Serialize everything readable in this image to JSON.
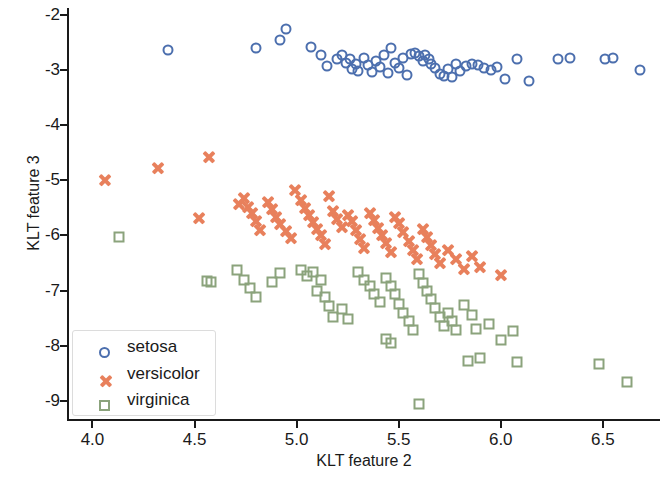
{
  "chart_data": {
    "type": "scatter",
    "title": "",
    "xlabel": "KLT feature 2",
    "ylabel": "KLT feature 3",
    "xlim": [
      3.88,
      6.78
    ],
    "ylim": [
      -9.35,
      -1.87
    ],
    "xticks": [
      4.0,
      4.5,
      5.0,
      5.5,
      6.0,
      6.5
    ],
    "xtick_labels": [
      "4.0",
      "4.5",
      "5.0",
      "5.5",
      "6.0",
      "6.5"
    ],
    "yticks": [
      -2,
      -3,
      -4,
      -5,
      -6,
      -7,
      -8,
      -9
    ],
    "ytick_labels": [
      "-2",
      "-3",
      "-4",
      "-5",
      "-6",
      "-7",
      "-8",
      "-9"
    ],
    "grid": false,
    "legend_position": "lower left",
    "series": [
      {
        "name": "setosa",
        "marker": "circle",
        "color": "#4c6fae",
        "points": [
          [
            4.37,
            -2.63
          ],
          [
            4.8,
            -2.6
          ],
          [
            4.92,
            -2.46
          ],
          [
            4.95,
            -2.26
          ],
          [
            5.07,
            -2.58
          ],
          [
            5.12,
            -2.72
          ],
          [
            5.15,
            -2.93
          ],
          [
            5.2,
            -2.8
          ],
          [
            5.22,
            -2.73
          ],
          [
            5.24,
            -2.86
          ],
          [
            5.26,
            -2.79
          ],
          [
            5.27,
            -2.98
          ],
          [
            5.29,
            -2.88
          ],
          [
            5.3,
            -3.01
          ],
          [
            5.33,
            -2.77
          ],
          [
            5.35,
            -2.9
          ],
          [
            5.37,
            -3.04
          ],
          [
            5.39,
            -2.83
          ],
          [
            5.41,
            -2.95
          ],
          [
            5.43,
            -2.72
          ],
          [
            5.45,
            -3.05
          ],
          [
            5.46,
            -2.6
          ],
          [
            5.48,
            -2.86
          ],
          [
            5.5,
            -2.96
          ],
          [
            5.52,
            -2.78
          ],
          [
            5.54,
            -3.08
          ],
          [
            5.56,
            -2.7
          ],
          [
            5.58,
            -2.68
          ],
          [
            5.6,
            -2.75
          ],
          [
            5.62,
            -2.84
          ],
          [
            5.63,
            -2.72
          ],
          [
            5.65,
            -2.79
          ],
          [
            5.66,
            -2.88
          ],
          [
            5.68,
            -2.96
          ],
          [
            5.7,
            -3.06
          ],
          [
            5.72,
            -3.11
          ],
          [
            5.74,
            -2.98
          ],
          [
            5.76,
            -3.12
          ],
          [
            5.78,
            -2.88
          ],
          [
            5.8,
            -3.02
          ],
          [
            5.83,
            -2.92
          ],
          [
            5.86,
            -2.88
          ],
          [
            5.89,
            -2.9
          ],
          [
            5.92,
            -2.96
          ],
          [
            5.95,
            -3.0
          ],
          [
            5.98,
            -2.95
          ],
          [
            6.02,
            -3.16
          ],
          [
            6.08,
            -2.8
          ],
          [
            6.14,
            -3.2
          ],
          [
            6.28,
            -2.8
          ],
          [
            6.34,
            -2.78
          ],
          [
            6.51,
            -2.8
          ],
          [
            6.55,
            -2.78
          ],
          [
            6.68,
            -3.0
          ]
        ]
      },
      {
        "name": "versicolor",
        "marker": "x",
        "color": "#e8805c",
        "points": [
          [
            4.06,
            -5.0
          ],
          [
            4.32,
            -4.78
          ],
          [
            4.57,
            -4.58
          ],
          [
            4.52,
            -5.68
          ],
          [
            4.72,
            -5.42
          ],
          [
            4.74,
            -5.32
          ],
          [
            4.76,
            -5.48
          ],
          [
            4.78,
            -5.6
          ],
          [
            4.8,
            -5.74
          ],
          [
            4.82,
            -5.9
          ],
          [
            4.86,
            -5.4
          ],
          [
            4.88,
            -5.52
          ],
          [
            4.9,
            -5.66
          ],
          [
            4.92,
            -5.8
          ],
          [
            4.95,
            -5.92
          ],
          [
            4.97,
            -6.04
          ],
          [
            4.99,
            -5.18
          ],
          [
            5.02,
            -5.36
          ],
          [
            5.04,
            -5.5
          ],
          [
            5.06,
            -5.62
          ],
          [
            5.08,
            -5.76
          ],
          [
            5.1,
            -5.88
          ],
          [
            5.12,
            -6.0
          ],
          [
            5.14,
            -6.16
          ],
          [
            5.16,
            -5.28
          ],
          [
            5.18,
            -5.56
          ],
          [
            5.2,
            -5.7
          ],
          [
            5.22,
            -5.84
          ],
          [
            5.25,
            -5.62
          ],
          [
            5.27,
            -5.74
          ],
          [
            5.29,
            -5.9
          ],
          [
            5.31,
            -6.06
          ],
          [
            5.33,
            -6.22
          ],
          [
            5.36,
            -5.6
          ],
          [
            5.38,
            -5.72
          ],
          [
            5.4,
            -5.86
          ],
          [
            5.42,
            -6.0
          ],
          [
            5.44,
            -6.14
          ],
          [
            5.46,
            -6.3
          ],
          [
            5.48,
            -5.66
          ],
          [
            5.5,
            -5.78
          ],
          [
            5.52,
            -5.94
          ],
          [
            5.55,
            -6.1
          ],
          [
            5.57,
            -6.26
          ],
          [
            5.59,
            -6.42
          ],
          [
            5.62,
            -5.88
          ],
          [
            5.64,
            -6.02
          ],
          [
            5.66,
            -6.18
          ],
          [
            5.68,
            -6.34
          ],
          [
            5.7,
            -6.5
          ],
          [
            5.74,
            -6.26
          ],
          [
            5.78,
            -6.42
          ],
          [
            5.82,
            -6.6
          ],
          [
            5.86,
            -6.38
          ],
          [
            5.9,
            -6.58
          ],
          [
            6.0,
            -6.72
          ]
        ]
      },
      {
        "name": "virginica",
        "marker": "square",
        "color": "#8ba37c",
        "points": [
          [
            4.13,
            -6.02
          ],
          [
            4.56,
            -6.82
          ],
          [
            4.58,
            -6.84
          ],
          [
            4.71,
            -6.62
          ],
          [
            4.74,
            -6.8
          ],
          [
            4.77,
            -6.96
          ],
          [
            4.8,
            -7.12
          ],
          [
            4.88,
            -6.84
          ],
          [
            4.92,
            -6.68
          ],
          [
            5.02,
            -6.62
          ],
          [
            5.05,
            -6.74
          ],
          [
            5.08,
            -6.66
          ],
          [
            5.12,
            -6.8
          ],
          [
            5.1,
            -7.0
          ],
          [
            5.14,
            -7.12
          ],
          [
            5.16,
            -7.28
          ],
          [
            5.18,
            -7.48
          ],
          [
            5.22,
            -7.34
          ],
          [
            5.25,
            -7.52
          ],
          [
            5.3,
            -6.66
          ],
          [
            5.33,
            -6.8
          ],
          [
            5.36,
            -6.92
          ],
          [
            5.38,
            -7.06
          ],
          [
            5.41,
            -7.2
          ],
          [
            5.44,
            -6.78
          ],
          [
            5.46,
            -6.92
          ],
          [
            5.48,
            -7.06
          ],
          [
            5.5,
            -7.24
          ],
          [
            5.52,
            -7.4
          ],
          [
            5.55,
            -7.56
          ],
          [
            5.57,
            -7.72
          ],
          [
            5.44,
            -7.88
          ],
          [
            5.46,
            -7.96
          ],
          [
            5.6,
            -6.7
          ],
          [
            5.62,
            -6.86
          ],
          [
            5.64,
            -7.0
          ],
          [
            5.66,
            -7.16
          ],
          [
            5.68,
            -7.32
          ],
          [
            5.7,
            -7.48
          ],
          [
            5.72,
            -7.64
          ],
          [
            5.74,
            -7.4
          ],
          [
            5.76,
            -7.56
          ],
          [
            5.78,
            -7.72
          ],
          [
            5.6,
            -9.06
          ],
          [
            5.82,
            -7.26
          ],
          [
            5.86,
            -7.44
          ],
          [
            5.84,
            -8.28
          ],
          [
            5.9,
            -8.22
          ],
          [
            5.88,
            -7.7
          ],
          [
            5.94,
            -7.6
          ],
          [
            6.0,
            -7.9
          ],
          [
            6.06,
            -7.74
          ],
          [
            6.08,
            -8.3
          ],
          [
            6.48,
            -8.34
          ],
          [
            6.62,
            -8.66
          ]
        ]
      }
    ]
  },
  "legend": {
    "items": [
      {
        "label": "setosa",
        "marker": "circle",
        "color": "#4c6fae"
      },
      {
        "label": "versicolor",
        "marker": "x",
        "color": "#e8805c"
      },
      {
        "label": "virginica",
        "marker": "square",
        "color": "#8ba37c"
      }
    ]
  }
}
